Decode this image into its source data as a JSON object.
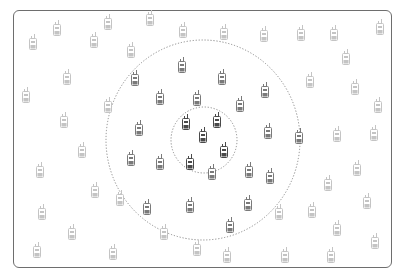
{
  "diagram": {
    "colors": {
      "frame": "#6e6e6e",
      "ring": "#8a8a8a",
      "near": "#4a4a4a",
      "mid": "#7a7a7a",
      "far": "#c4c4c4"
    },
    "zones": [
      {
        "name": "inner-range",
        "style": "dotted"
      },
      {
        "name": "outer-range",
        "style": "dotted"
      }
    ],
    "radios": [
      {
        "zone": "near",
        "x": 186,
        "y": 122
      },
      {
        "zone": "near",
        "x": 217,
        "y": 120
      },
      {
        "zone": "near",
        "x": 203,
        "y": 135
      },
      {
        "zone": "near",
        "x": 224,
        "y": 150
      },
      {
        "zone": "near",
        "x": 190,
        "y": 162
      },
      {
        "zone": "mid",
        "x": 212,
        "y": 172
      },
      {
        "zone": "mid",
        "x": 135,
        "y": 78
      },
      {
        "zone": "mid",
        "x": 182,
        "y": 65
      },
      {
        "zone": "mid",
        "x": 222,
        "y": 77
      },
      {
        "zone": "mid",
        "x": 265,
        "y": 90
      },
      {
        "zone": "mid",
        "x": 160,
        "y": 97
      },
      {
        "zone": "mid",
        "x": 197,
        "y": 98
      },
      {
        "zone": "mid",
        "x": 240,
        "y": 104
      },
      {
        "zone": "mid",
        "x": 268,
        "y": 131
      },
      {
        "zone": "mid",
        "x": 139,
        "y": 128
      },
      {
        "zone": "mid",
        "x": 299,
        "y": 136
      },
      {
        "zone": "mid",
        "x": 131,
        "y": 158
      },
      {
        "zone": "mid",
        "x": 160,
        "y": 162
      },
      {
        "zone": "mid",
        "x": 249,
        "y": 170
      },
      {
        "zone": "mid",
        "x": 270,
        "y": 176
      },
      {
        "zone": "mid",
        "x": 147,
        "y": 207
      },
      {
        "zone": "mid",
        "x": 190,
        "y": 205
      },
      {
        "zone": "mid",
        "x": 248,
        "y": 203
      },
      {
        "zone": "mid",
        "x": 230,
        "y": 225
      },
      {
        "zone": "far",
        "x": 57,
        "y": 28
      },
      {
        "zone": "far",
        "x": 33,
        "y": 42
      },
      {
        "zone": "far",
        "x": 94,
        "y": 40
      },
      {
        "zone": "far",
        "x": 108,
        "y": 22
      },
      {
        "zone": "far",
        "x": 150,
        "y": 18
      },
      {
        "zone": "far",
        "x": 131,
        "y": 50
      },
      {
        "zone": "far",
        "x": 183,
        "y": 30
      },
      {
        "zone": "far",
        "x": 224,
        "y": 32
      },
      {
        "zone": "far",
        "x": 264,
        "y": 34
      },
      {
        "zone": "far",
        "x": 301,
        "y": 33
      },
      {
        "zone": "far",
        "x": 334,
        "y": 33
      },
      {
        "zone": "far",
        "x": 380,
        "y": 27
      },
      {
        "zone": "far",
        "x": 346,
        "y": 57
      },
      {
        "zone": "far",
        "x": 67,
        "y": 77
      },
      {
        "zone": "far",
        "x": 310,
        "y": 80
      },
      {
        "zone": "far",
        "x": 355,
        "y": 87
      },
      {
        "zone": "far",
        "x": 26,
        "y": 95
      },
      {
        "zone": "far",
        "x": 108,
        "y": 105
      },
      {
        "zone": "far",
        "x": 378,
        "y": 105
      },
      {
        "zone": "far",
        "x": 64,
        "y": 120
      },
      {
        "zone": "far",
        "x": 337,
        "y": 134
      },
      {
        "zone": "far",
        "x": 374,
        "y": 133
      },
      {
        "zone": "far",
        "x": 82,
        "y": 150
      },
      {
        "zone": "far",
        "x": 40,
        "y": 170
      },
      {
        "zone": "far",
        "x": 357,
        "y": 168
      },
      {
        "zone": "far",
        "x": 328,
        "y": 183
      },
      {
        "zone": "far",
        "x": 95,
        "y": 190
      },
      {
        "zone": "far",
        "x": 120,
        "y": 198
      },
      {
        "zone": "far",
        "x": 367,
        "y": 201
      },
      {
        "zone": "far",
        "x": 312,
        "y": 210
      },
      {
        "zone": "far",
        "x": 279,
        "y": 212
      },
      {
        "zone": "far",
        "x": 42,
        "y": 212
      },
      {
        "zone": "far",
        "x": 337,
        "y": 228
      },
      {
        "zone": "far",
        "x": 72,
        "y": 232
      },
      {
        "zone": "far",
        "x": 164,
        "y": 232
      },
      {
        "zone": "far",
        "x": 375,
        "y": 241
      },
      {
        "zone": "far",
        "x": 37,
        "y": 250
      },
      {
        "zone": "far",
        "x": 113,
        "y": 252
      },
      {
        "zone": "far",
        "x": 197,
        "y": 248
      },
      {
        "zone": "far",
        "x": 227,
        "y": 255
      },
      {
        "zone": "far",
        "x": 285,
        "y": 255
      },
      {
        "zone": "far",
        "x": 331,
        "y": 255
      }
    ]
  }
}
